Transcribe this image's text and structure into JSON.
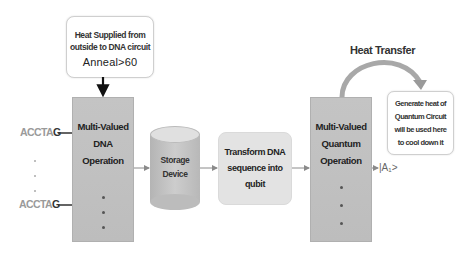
{
  "heat_supply": {
    "line1": "Heat Supplied from",
    "line2": "outside to DNA circuit",
    "condition": "Anneal>60"
  },
  "dna_operation": {
    "line1": "Multi-Valued",
    "line2": "DNA",
    "line3": "Operation"
  },
  "inputs": [
    {
      "prefix": "ACCTA",
      "suffix": "G"
    },
    {
      "prefix": "ACCTA",
      "suffix": "G"
    }
  ],
  "storage": {
    "line1": "Storage",
    "line2": "Device"
  },
  "transform": {
    "line1": "Transform DNA",
    "line2": "sequence into",
    "line3": "qubit"
  },
  "quantum_operation": {
    "line1": "Multi-Valued",
    "line2": "Quantum",
    "line3": "Operation"
  },
  "heat_transfer": {
    "label": "Heat Transfer"
  },
  "cool_down": {
    "line1": "Generate heat of",
    "line2": "Quantum Circuit",
    "line3": "will be used here",
    "line4": "to cool down it"
  },
  "output": {
    "ket": "|A₁>"
  },
  "colors": {
    "op_box": "#c0c0c0",
    "transform_box": "#e3e3e3",
    "arrow": "#8a8a8a",
    "arc": "#a8a8a8"
  }
}
